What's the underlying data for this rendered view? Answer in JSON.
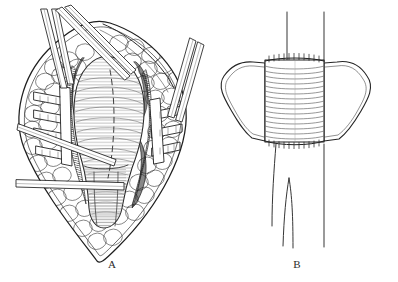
{
  "figure": {
    "kind": "medical-line-illustration",
    "technique": "pen-and-ink line drawing",
    "background_color": "#ffffff",
    "ink_color": "#222222",
    "light_ink_color": "#555555",
    "width": 398,
    "height": 282,
    "panel_count": 2
  },
  "panels": [
    {
      "id": "A",
      "caption": "A",
      "title": "Exposed aneurysm in opened retroperitoneum",
      "position": "left",
      "elements": {
        "wound_outline": "lens-shaped laparotomy opening",
        "tissue_texture": "cobblestone / scalloped fat lobules",
        "central_structure": "bulging aneurysm sac with dashed midline incision guide",
        "retractor_blades": "two ladder-style self-retaining retractor blades, left and right",
        "instrument_shafts": "four long straight instrument shafts entering from upper-left, upper-right and lower-left",
        "shading": "fine parallel hatching on sac and shadowed gutters"
      }
    },
    {
      "id": "B",
      "caption": "B",
      "title": "Completed corrugated tube graft with sutured anastomoses",
      "position": "right",
      "elements": {
        "graft": "corrugated (ribbed) tubular prosthetic graft",
        "corrugation_count": 17,
        "anastomosis_lines": "proximal and distal running suture lines with tick-mark stitches",
        "sac_wings": "opened aneurysm sac wall retracted laterally to left and right",
        "proximal_vessel": "native aorta continuing upward",
        "distal_vessel": "native aorta continuing downward toward bifurcation",
        "bifurcation": "distal iliac bifurcation sketched below"
      }
    }
  ],
  "captions": {
    "panel_a_label": "A",
    "panel_b_label": "B"
  }
}
